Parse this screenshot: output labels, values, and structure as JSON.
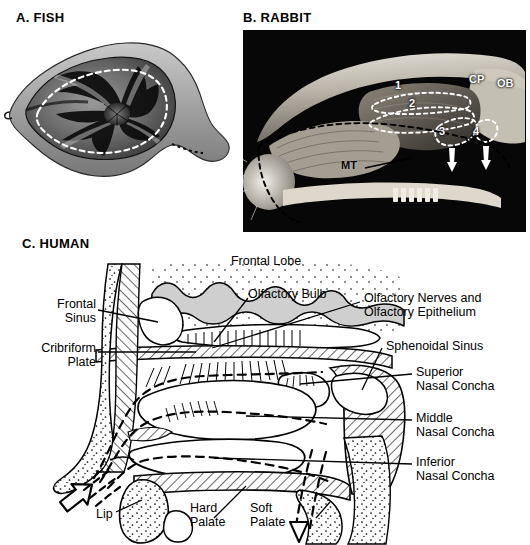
{
  "figure": {
    "background": "#ffffff",
    "panels": [
      {
        "id": "fish",
        "heading": "A. FISH"
      },
      {
        "id": "rabbit",
        "heading": "B. RABBIT"
      },
      {
        "id": "human",
        "heading": "C. HUMAN"
      }
    ]
  },
  "panel_a": {
    "heading": "A. FISH",
    "caption_note": "Dissected fish olfactory rosette, lamellae radiating from a central raphe; dashed white line traces the water flow path through the olfactory chamber."
  },
  "panel_b": {
    "heading": "B. RABBIT",
    "background": "#050505",
    "labels": [
      {
        "name": "ethmoturbinate-1",
        "text": "1",
        "color": "#ffffff"
      },
      {
        "name": "ethmoturbinate-2",
        "text": "2",
        "color": "#ffffff"
      },
      {
        "name": "ethmoturbinate-3",
        "text": "3",
        "color": "#ffffff"
      },
      {
        "name": "ethmoturbinate-4",
        "text": "4",
        "color": "#ffffff"
      },
      {
        "name": "cribriform-plate",
        "text": "CP",
        "color": "#ffffff"
      },
      {
        "name": "olfactory-bulb",
        "text": "OB",
        "color": "#ffffff"
      },
      {
        "name": "maxilloturbinate",
        "text": "MT",
        "color": "#000000"
      }
    ]
  },
  "panel_c": {
    "heading": "C. HUMAN",
    "labels": {
      "frontal_lobe": "Frontal Lobe",
      "olfactory_bulb": "Olfactory Bulb",
      "olfactory_nerves": "Olfactory Nerves and\nOlfactory Epithelium",
      "frontal_sinus": "Frontal\nSinus",
      "cribriform_plate": "Cribriform\nPlate",
      "sphenoidal_sinus": "Sphenoidal Sinus",
      "superior_concha": "Superior\nNasal Concha",
      "middle_concha": "Middle\nNasal Concha",
      "inferior_concha": "Inferior\nNasal Concha",
      "lip": "Lip",
      "hard_palate": "Hard\nPalate",
      "soft_palate": "Soft\nPalate"
    },
    "airflow": {
      "inflow_arrow": "inflow-arrow",
      "outflow_arrow": "outflow-arrow",
      "style": "dashed"
    }
  }
}
